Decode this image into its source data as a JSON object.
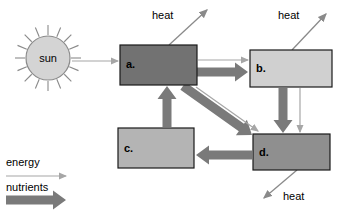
{
  "diagram": {
    "canvas": {
      "width": 344,
      "height": 220,
      "background": "#ffffff"
    },
    "sun": {
      "label": "sun",
      "fill": "#d4d4d4",
      "stroke": "#8a8a8a",
      "cx": 48,
      "cy": 58,
      "r": 22,
      "ray_count": 16,
      "ray_inner": 23,
      "ray_outer": 33
    },
    "boxes": [
      {
        "id": "a",
        "label": "a.",
        "x": 120,
        "y": 45,
        "w": 77,
        "h": 40,
        "fill": "#727272",
        "stroke": "#1a1a1a",
        "label_x": 126,
        "label_y": 68
      },
      {
        "id": "b",
        "label": "b.",
        "x": 250,
        "y": 50,
        "w": 82,
        "h": 37,
        "fill": "#d0d0d0",
        "stroke": "#1a1a1a",
        "label_x": 256,
        "label_y": 72
      },
      {
        "id": "c",
        "label": "c.",
        "x": 118,
        "y": 128,
        "w": 76,
        "h": 40,
        "fill": "#b4b4b4",
        "stroke": "#1a1a1a",
        "label_x": 124,
        "label_y": 152
      },
      {
        "id": "d",
        "label": "d.",
        "x": 253,
        "y": 134,
        "w": 77,
        "h": 36,
        "fill": "#8f8f8f",
        "stroke": "#1a1a1a",
        "label_x": 259,
        "label_y": 156
      }
    ],
    "heat_labels": [
      {
        "id": "heat-a",
        "text": "heat",
        "x": 152,
        "y": 19
      },
      {
        "id": "heat-b",
        "text": "heat",
        "x": 278,
        "y": 19
      },
      {
        "id": "heat-d",
        "text": "heat",
        "x": 283,
        "y": 200
      }
    ],
    "heat_arrows": [
      {
        "id": "heat-arrow-a",
        "x1": 169,
        "y1": 45,
        "x2": 207,
        "y2": 10
      },
      {
        "id": "heat-arrow-b",
        "x1": 292,
        "y1": 50,
        "x2": 326,
        "y2": 14
      },
      {
        "id": "heat-arrow-d",
        "x1": 297,
        "y1": 170,
        "x2": 264,
        "y2": 198
      }
    ],
    "energy_flows": [
      {
        "id": "energy-sun-to-a",
        "from": "sun",
        "to": "a",
        "x1": 72,
        "y1": 61,
        "x2": 118,
        "y2": 61
      },
      {
        "id": "energy-a-to-b",
        "from": "a",
        "to": "b",
        "x1": 198,
        "y1": 60,
        "x2": 248,
        "y2": 60
      },
      {
        "id": "energy-b-to-d",
        "from": "b",
        "to": "d",
        "x1": 300,
        "y1": 88,
        "x2": 300,
        "y2": 132
      },
      {
        "id": "energy-a-to-d",
        "from": "a",
        "to": "d",
        "x1": 196,
        "y1": 87,
        "x2": 258,
        "y2": 131
      }
    ],
    "nutrient_flows": [
      {
        "id": "nutrients-a-to-b",
        "from": "a",
        "to": "b",
        "x1": 197,
        "y1": 72,
        "x2": 248,
        "y2": 72
      },
      {
        "id": "nutrients-a-to-d",
        "from": "a",
        "to": "d",
        "x1": 183,
        "y1": 86,
        "x2": 252,
        "y2": 135
      },
      {
        "id": "nutrients-b-to-d",
        "from": "b",
        "to": "d",
        "x1": 283,
        "y1": 88,
        "x2": 283,
        "y2": 133
      },
      {
        "id": "nutrients-d-to-c",
        "from": "d",
        "to": "c",
        "x1": 252,
        "y1": 155,
        "x2": 196,
        "y2": 155
      },
      {
        "id": "nutrients-c-to-a",
        "from": "c",
        "to": "a",
        "x1": 167,
        "y1": 127,
        "x2": 167,
        "y2": 86
      }
    ],
    "legend": {
      "energy": {
        "label": "energy",
        "label_x": 6,
        "label_y": 166,
        "arrow_x1": 6,
        "arrow_y1": 176,
        "arrow_x2": 66,
        "arrow_y2": 176
      },
      "nutrients": {
        "label": "nutrients",
        "label_x": 6,
        "label_y": 191,
        "arrow_x1": 6,
        "arrow_y1": 200,
        "arrow_x2": 66,
        "arrow_y2": 200
      }
    },
    "colors": {
      "energy_arrow": "#a6a6a6",
      "nutrient_arrow": "#7a7a7a",
      "heat_arrow": "#8a8a8a",
      "text": "#000000"
    }
  }
}
